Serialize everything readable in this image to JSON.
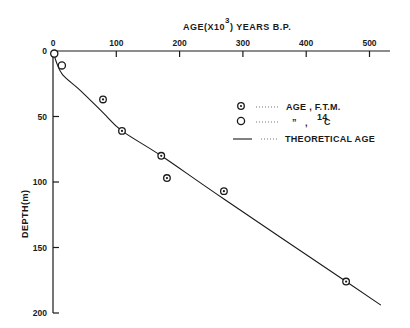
{
  "chart_data": {
    "type": "scatter",
    "title": "",
    "xlabel": "AGE(X10³) YEARS B.P.",
    "xlabel_main": "AGE(X10",
    "xlabel_exp": "3",
    "xlabel_tail": ")  YEARS B.P.",
    "ylabel": "DEPTH(m)",
    "xlim": [
      0,
      520
    ],
    "ylim": [
      0,
      200
    ],
    "y_inverted": true,
    "x_axis_position": "top",
    "grid": false,
    "x_ticks": [
      "0",
      "100",
      "200",
      "300",
      "400",
      "500"
    ],
    "y_ticks": [
      "0",
      "50",
      "100",
      "150",
      "200"
    ],
    "legend_position": "upper right (inside)",
    "legend": [
      {
        "marker": "dotted-circle",
        "label": "AGE , F.T.M."
      },
      {
        "marker": "open-circle",
        "label_ditto": "”",
        "label_sep": ",",
        "label_sup": "14",
        "label_tail": "C",
        "label": "” , 14C"
      },
      {
        "marker": "line",
        "label": "THEORETICAL AGE"
      }
    ],
    "series": [
      {
        "name": "AGE, F.T.M.",
        "marker": "dotted-circle",
        "points": [
          {
            "x": 79,
            "y": 37
          },
          {
            "x": 109,
            "y": 61
          },
          {
            "x": 171,
            "y": 80
          },
          {
            "x": 180,
            "y": 97
          },
          {
            "x": 270,
            "y": 107
          },
          {
            "x": 463,
            "y": 176
          }
        ]
      },
      {
        "name": "AGE, 14C",
        "marker": "open-circle",
        "points": [
          {
            "x": 2,
            "y": 2
          },
          {
            "x": 14,
            "y": 11
          }
        ]
      },
      {
        "name": "THEORETICAL AGE",
        "type": "line",
        "points": [
          {
            "x": 0,
            "y": 0
          },
          {
            "x": 5,
            "y": 8
          },
          {
            "x": 15,
            "y": 18
          },
          {
            "x": 43,
            "y": 30
          },
          {
            "x": 79,
            "y": 47
          },
          {
            "x": 109,
            "y": 61
          },
          {
            "x": 171,
            "y": 80
          },
          {
            "x": 270,
            "y": 113
          },
          {
            "x": 463,
            "y": 176
          },
          {
            "x": 518,
            "y": 194
          }
        ]
      }
    ]
  }
}
